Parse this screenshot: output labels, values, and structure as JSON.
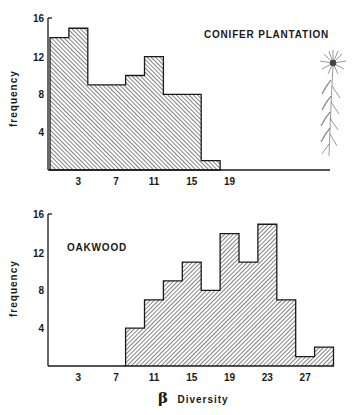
{
  "chart_data": [
    {
      "type": "bar",
      "title": "CONIFER PLANTATION",
      "xlabel": "",
      "ylabel": "frequency",
      "bin_edges": [
        0,
        2,
        4,
        6,
        8,
        10,
        12,
        14,
        16,
        18
      ],
      "categories": [
        "0-2",
        "2-4",
        "4-6",
        "6-8",
        "8-10",
        "10-12",
        "12-14",
        "14-16",
        "16-18"
      ],
      "values": [
        14,
        15,
        9,
        9,
        10,
        12,
        8,
        8,
        1
      ],
      "x_ticks": [
        3,
        7,
        11,
        15,
        19
      ],
      "y_ticks": [
        4,
        8,
        12,
        16
      ],
      "ylim": [
        0,
        16
      ],
      "xlim": [
        0,
        30
      ],
      "hatch": "backslash",
      "grid": false,
      "annotation": "line drawing of a flowering plant"
    },
    {
      "type": "bar",
      "title": "OAKWOOD",
      "xlabel": "β Diversity",
      "ylabel": "frequency",
      "bin_edges": [
        8,
        10,
        12,
        14,
        16,
        18,
        20,
        22,
        24,
        26,
        28,
        30
      ],
      "categories": [
        "8-10",
        "10-12",
        "12-14",
        "14-16",
        "16-18",
        "18-20",
        "20-22",
        "22-24",
        "24-26",
        "26-28",
        "28-30"
      ],
      "values": [
        4,
        7,
        9,
        11,
        8,
        14,
        11,
        15,
        7,
        1,
        2
      ],
      "x_ticks": [
        3,
        7,
        11,
        15,
        19,
        23,
        27
      ],
      "y_ticks": [
        4,
        8,
        12,
        16
      ],
      "ylim": [
        0,
        16
      ],
      "xlim": [
        0,
        30
      ],
      "hatch": "slash",
      "grid": false
    }
  ],
  "labels": {
    "top_title": "CONIFER PLANTATION",
    "bottom_title": "OAKWOOD",
    "ylabel": "frequency",
    "xlabel_symbol": "β",
    "xlabel_text": "Diversity"
  },
  "colors": {
    "ink": "#1a1a1a",
    "background": "#ffffff"
  }
}
